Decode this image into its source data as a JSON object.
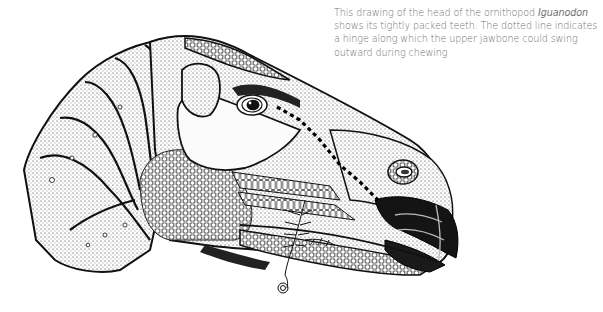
{
  "caption": {
    "part1": "This drawing of the head of the ornithopod ",
    "species": "Iguanodon",
    "part2": " shows its tightly packed teeth. The dotted line indicates a hinge along which the upper jawbone could swing outward during chewing"
  },
  "illustration": {
    "subject": "Iguanodon head, side view facing right",
    "style": "stippled pen-and-ink",
    "annotation": "dotted hinge line along upper jawbone"
  }
}
